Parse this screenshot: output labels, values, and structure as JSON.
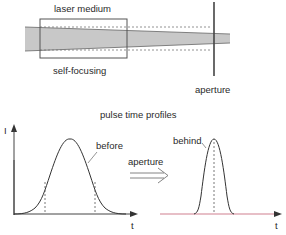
{
  "top_diagram": {
    "medium_label": "laser medium",
    "focusing_label": "self-focusing",
    "aperture_label": "aperture",
    "colors": {
      "beam": "#c8c8c8",
      "outline": "#555555",
      "dashed": "#777777"
    }
  },
  "bottom_diagram": {
    "title": "pulse time profiles",
    "y_axis_label": "I",
    "x_axis_label_left": "t",
    "x_axis_label_right": "t",
    "before_label": "before",
    "behind_label": "behind",
    "arrow_label": "aperture",
    "colors": {
      "curve": "#333333",
      "baseline_right": "#d08090"
    }
  }
}
